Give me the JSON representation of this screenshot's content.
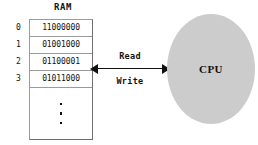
{
  "diagram": {
    "ram": {
      "title": "RAM",
      "rows": [
        {
          "index": "0",
          "value": "11000000"
        },
        {
          "index": "1",
          "value": "01001000"
        },
        {
          "index": "2",
          "value": "01100001"
        },
        {
          "index": "3",
          "value": "01011000"
        }
      ],
      "ellipsis": "vertical-ellipsis"
    },
    "bus": {
      "read_label": "Read",
      "write_label": "Write",
      "direction": "bidirectional"
    },
    "cpu": {
      "label": "CPU"
    },
    "colors": {
      "background": "#ffffff",
      "cpu_fill": "#cccccc",
      "line": "#111111",
      "table_border": "#9a9a9a"
    }
  }
}
